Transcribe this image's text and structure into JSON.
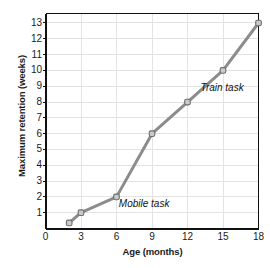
{
  "chart_data": {
    "type": "line",
    "title": "",
    "xlabel": "Age (months)",
    "ylabel": "Maximum retention (weeks)",
    "xlim": [
      0,
      18
    ],
    "ylim": [
      0,
      13.6
    ],
    "xticks": [
      "0",
      "3",
      "6",
      "9",
      "12",
      "15",
      "18"
    ],
    "xtick_values": [
      0,
      3,
      6,
      9,
      12,
      15,
      18
    ],
    "yticks": [
      "1",
      "2",
      "3",
      "4",
      "5",
      "6",
      "7",
      "8",
      "9",
      "10",
      "11",
      "12",
      "13"
    ],
    "ytick_values": [
      1,
      2,
      3,
      4,
      5,
      6,
      7,
      8,
      9,
      10,
      11,
      12,
      13
    ],
    "grid": true,
    "legend": "none",
    "series": [
      {
        "name": "Maximum retention",
        "x": [
          2,
          3,
          6,
          9,
          12,
          15,
          18
        ],
        "values": [
          0.35,
          1,
          2,
          6,
          8,
          10,
          13
        ],
        "color": "#8c8c8c",
        "marker": "square-circle"
      }
    ],
    "annotations": [
      {
        "text": "Mobile task",
        "x": 6.2,
        "y": 1.55
      },
      {
        "text": "Train task",
        "x": 13.1,
        "y": 8.9
      }
    ]
  },
  "colors": {
    "line": "#8c8c8c",
    "marker_fill": "#c9c9c9",
    "marker_stroke": "#6e6e6e",
    "axis": "#111111",
    "grid": "#e3e3e3",
    "text": "#1a1a1a",
    "background": "#ffffff"
  }
}
